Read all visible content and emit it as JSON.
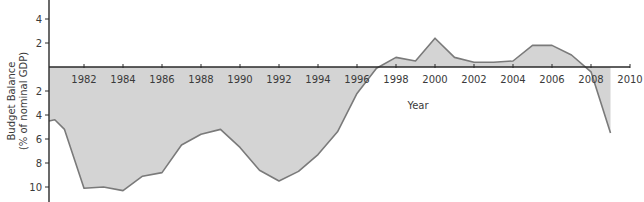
{
  "chart_data": {
    "type": "area",
    "title": "",
    "xlabel": "Year",
    "ylabel": "Budget Balance (% of nominal GDP)",
    "ylabel_lines": [
      "Budget Balance",
      "(% of nominal GDP)"
    ],
    "xlim": [
      1980,
      2010
    ],
    "ylim": [
      -10.5,
      5.5
    ],
    "grid": false,
    "legend": null,
    "x_ticks": [
      1982,
      1984,
      1986,
      1988,
      1990,
      1992,
      1994,
      1996,
      1998,
      2000,
      2002,
      2004,
      2006,
      2008,
      2010
    ],
    "y_ticks": [
      {
        "value": 4,
        "label": "4"
      },
      {
        "value": 2,
        "label": "2"
      },
      {
        "value": -2,
        "label": "2"
      },
      {
        "value": -4,
        "label": "4"
      },
      {
        "value": -6,
        "label": "6"
      },
      {
        "value": -8,
        "label": "8"
      },
      {
        "value": -10,
        "label": "10"
      }
    ],
    "note": "Values above the axis are surpluses; values below are deficits (tick labels show magnitude).",
    "series": [
      {
        "name": "Budget Balance",
        "x": [
          1980,
          1980.5,
          1981,
          1982,
          1983,
          1984,
          1985,
          1986,
          1987,
          1988,
          1989,
          1990,
          1991,
          1992,
          1993,
          1994,
          1995,
          1996,
          1997,
          1998,
          1999,
          2000,
          2001,
          2002,
          2003,
          2004,
          2005,
          2006,
          2007,
          2008,
          2009
        ],
        "values": [
          -4.5,
          -4.4,
          -5.2,
          -10.1,
          -10.0,
          -10.3,
          -9.1,
          -8.8,
          -6.5,
          -5.6,
          -5.2,
          -6.7,
          -8.6,
          -9.5,
          -8.7,
          -7.3,
          -5.4,
          -2.2,
          -0.1,
          0.8,
          0.5,
          2.4,
          0.8,
          0.4,
          0.4,
          0.5,
          1.8,
          1.8,
          1.0,
          -0.4,
          -5.5
        ]
      }
    ],
    "colors": {
      "fill": "#d4d4d4",
      "line": "#7a7a7a",
      "axis": "#2a2a2a",
      "text": "#3a3a3a"
    }
  }
}
